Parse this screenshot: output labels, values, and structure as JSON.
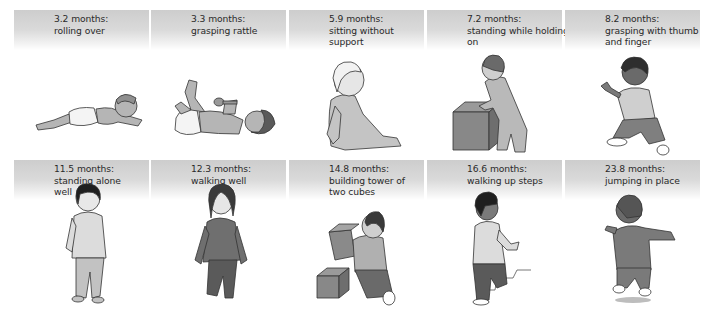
{
  "milestones": [
    {
      "age": "3.2 months:",
      "lines": [
        "rolling over"
      ],
      "illustration": "baby-lying-on-stomach"
    },
    {
      "age": "3.3 months:",
      "lines": [
        "grasping rattle"
      ],
      "illustration": "baby-on-back-holding-rattle"
    },
    {
      "age": "5.9 months:",
      "lines": [
        "sitting without",
        "support"
      ],
      "illustration": "baby-sitting"
    },
    {
      "age": "7.2 months:",
      "lines": [
        "standing while holding",
        "on"
      ],
      "illustration": "baby-standing-holding-box"
    },
    {
      "age": "8.2 months:",
      "lines": [
        "grasping with thumb",
        "and finger"
      ],
      "illustration": "baby-sitting-pincer-grasp"
    },
    {
      "age": "11.5 months:",
      "lines": [
        "standing alone",
        "well"
      ],
      "illustration": "toddler-standing"
    },
    {
      "age": "12.3 months:",
      "lines": [
        "walking well"
      ],
      "illustration": "toddler-walking"
    },
    {
      "age": "14.8 months:",
      "lines": [
        "building tower of",
        "two cubes"
      ],
      "illustration": "toddler-kneeling-stacking-cubes"
    },
    {
      "age": "16.6 months:",
      "lines": [
        "walking up steps"
      ],
      "illustration": "toddler-climbing-steps"
    },
    {
      "age": "23.8 months:",
      "lines": [
        "jumping in place"
      ],
      "illustration": "toddler-jumping"
    }
  ],
  "colors": {
    "header_top": "#cdcdcd",
    "header_bottom": "#ffffff",
    "text": "#2a2a2a",
    "figure_fill": "#b9b9b9",
    "figure_dark": "#7a7a7a",
    "outline": "#333333"
  }
}
